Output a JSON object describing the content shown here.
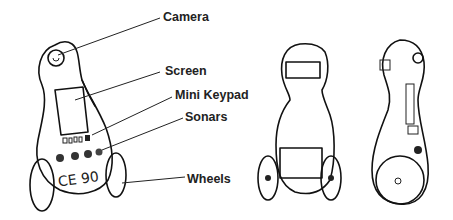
{
  "diagram": {
    "labels": {
      "camera": "Camera",
      "screen": "Screen",
      "mini_keypad": "Mini Keypad",
      "sonars": "Sonars",
      "wheels": "Wheels"
    },
    "robot_marking": "CE 90",
    "views": [
      "three-quarter view (labeled)",
      "front view",
      "side view"
    ]
  }
}
